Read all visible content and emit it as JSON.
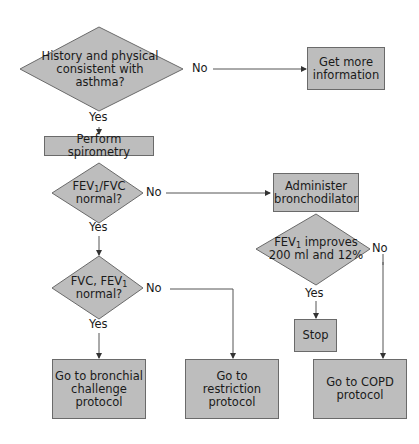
{
  "diagram": {
    "type": "flowchart",
    "nodes": {
      "q_history": {
        "shape": "diamond",
        "text": "History and physical consistent with asthma?"
      },
      "get_info": {
        "shape": "box",
        "line1": "Get more",
        "line2": "information"
      },
      "spirometry": {
        "shape": "box",
        "text": "Perform spirometry"
      },
      "q_ratio": {
        "shape": "diamond",
        "line1_a": "FEV",
        "line1_sub": "1",
        "line1_b": "/FVC",
        "line2": "normal?"
      },
      "bronchodilator": {
        "shape": "box",
        "line1": "Administer",
        "line2": "bronchodilator"
      },
      "q_improves": {
        "shape": "diamond",
        "line1_a": "FEV",
        "line1_sub": "1",
        "line1_b": " improves",
        "line2": "200 ml and 12%"
      },
      "q_fvc": {
        "shape": "diamond",
        "line1_a": "FVC, FEV",
        "line1_sub": "1",
        "line2": "normal?"
      },
      "stop": {
        "shape": "box",
        "text": "Stop"
      },
      "bronchial": {
        "shape": "box",
        "line1": "Go to bronchial",
        "line2": "challenge",
        "line3": "protocol"
      },
      "restriction": {
        "shape": "box",
        "line1": "Go to",
        "line2": "restriction",
        "line3": "protocol"
      },
      "copd": {
        "shape": "box",
        "line1": "Go to COPD",
        "line2": "protocol"
      }
    },
    "labels": {
      "yes": "Yes",
      "no": "No"
    },
    "colors": {
      "fill": "#bdbdbd",
      "stroke": "#6a6a6a",
      "line": "#555555"
    }
  }
}
